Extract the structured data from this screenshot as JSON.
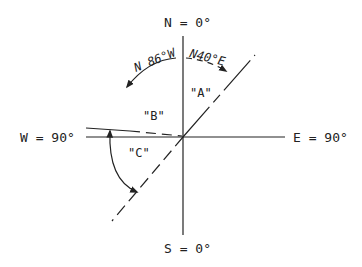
{
  "labels": {
    "north": "N = 0°",
    "south": "S = 0°",
    "east": "E = 90°",
    "west": "W = 90°"
  },
  "bearings": {
    "left": "N 86°W",
    "right": "N40°E"
  },
  "regions": {
    "a": "\"A\"",
    "b": "\"B\"",
    "c": "\"C\""
  },
  "colors": {
    "ink": "#222222",
    "background": "#ffffff"
  }
}
